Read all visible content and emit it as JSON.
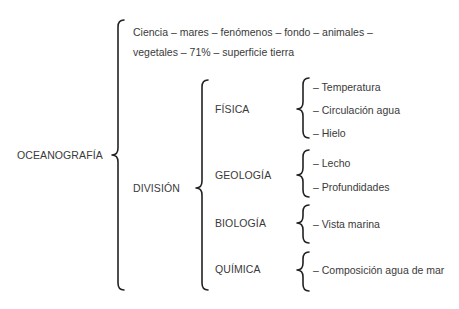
{
  "root": {
    "label": "OCEANOGRAFÍA",
    "definition": {
      "line1": "Ciencia – mares – fenómenos – fondo – animales –",
      "line2": "vegetales – 71% – superficie tierra"
    },
    "division": {
      "label": "DIVISIÓN",
      "branches": [
        {
          "label": "FÍSICA",
          "items": [
            "– Temperatura",
            "– Circulación agua",
            "– Hielo"
          ]
        },
        {
          "label": "GEOLOGÍA",
          "items": [
            "– Lecho",
            "– Profundidades"
          ]
        },
        {
          "label": "BIOLOGÍA",
          "items": [
            "– Vista marina"
          ]
        },
        {
          "label": "QUÍMICA",
          "items": [
            "– Composición agua de mar"
          ]
        }
      ]
    }
  }
}
